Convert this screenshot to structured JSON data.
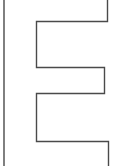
{
  "figure": {
    "shape": "letter-E-outline",
    "letter": "E",
    "stroke_color": "#4a4a4a",
    "fill_color": "#ffffff",
    "background": "#ffffff"
  }
}
